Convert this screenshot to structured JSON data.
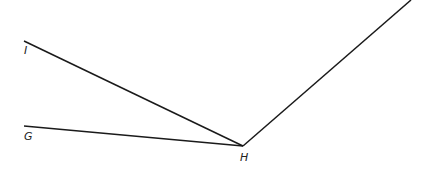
{
  "diagram": {
    "type": "angle-figure",
    "stroke_color": "#1a1a1a",
    "points": {
      "H": {
        "label": "H",
        "x": 243,
        "y": 146
      },
      "I": {
        "label": "I",
        "x": 24,
        "y": 41
      },
      "G": {
        "label": "G",
        "x": 24,
        "y": 126
      },
      "E": {
        "x": 411,
        "y": 0
      }
    },
    "segments": [
      {
        "from": "H",
        "to": "I"
      },
      {
        "from": "H",
        "to": "G"
      },
      {
        "from": "H",
        "to": "E"
      }
    ],
    "labels": {
      "I": "I",
      "G": "G",
      "H": "H"
    }
  }
}
